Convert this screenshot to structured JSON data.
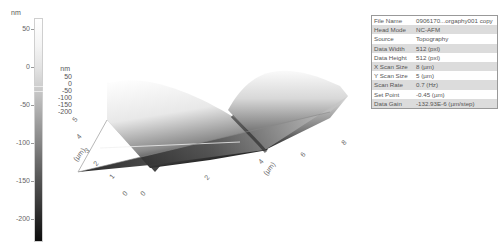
{
  "colorbar": {
    "unit": "nm",
    "ticks": [
      {
        "label": "50",
        "y": 29
      },
      {
        "label": "0",
        "y": 67
      },
      {
        "label": "-50",
        "y": 105
      },
      {
        "label": "-100",
        "y": 143
      },
      {
        "label": "-150",
        "y": 181
      },
      {
        "label": "-200",
        "y": 219
      }
    ]
  },
  "plot3d": {
    "z_unit": "nm",
    "z_ticks": [
      "50",
      "0",
      "-50",
      "-100",
      "-150",
      "-200"
    ],
    "y_unit": "(µm)",
    "y_ticks": [
      "5",
      "4",
      "3",
      "2",
      "1",
      "0"
    ],
    "x_unit": "(µm)",
    "x_ticks": [
      "0",
      "2",
      "4",
      "6",
      "8"
    ]
  },
  "info_table": [
    {
      "key": "File Name",
      "value": "0906170...orgaphy001 copy"
    },
    {
      "key": "Head Mode",
      "value": "NC-AFM"
    },
    {
      "key": "Source",
      "value": "Topography"
    },
    {
      "key": "Data Width",
      "value": "512 (pxl)"
    },
    {
      "key": "Data Height",
      "value": "512 (pxl)"
    },
    {
      "key": "X Scan Size",
      "value": "8 (µm)"
    },
    {
      "key": "Y Scan Size",
      "value": "5 (µm)"
    },
    {
      "key": "Scan Rate",
      "value": "0.7 (Hz)"
    },
    {
      "key": "Set Point",
      "value": "-0.45 (µm)"
    },
    {
      "key": "Data Gain",
      "value": "-132.93E-6 (µm/step)"
    }
  ],
  "chart_data": {
    "type": "heatmap",
    "surface": "two ridges separated by a valley near x≈4 µm",
    "x": {
      "label": "(µm)",
      "ticks": [
        0,
        2,
        4,
        6,
        8
      ],
      "range": [
        0,
        8
      ]
    },
    "y": {
      "label": "(µm)",
      "ticks": [
        0,
        1,
        2,
        3,
        4,
        5
      ],
      "range": [
        0,
        5
      ]
    },
    "z": {
      "label": "nm",
      "ticks": [
        50,
        0,
        -50,
        -100,
        -150,
        -200
      ],
      "range": [
        -230,
        60
      ]
    },
    "colorbar": {
      "unit": "nm",
      "ticks": [
        50,
        0,
        -50,
        -100,
        -150,
        -200
      ],
      "range": [
        -230,
        60
      ],
      "colormap": "gray"
    }
  }
}
